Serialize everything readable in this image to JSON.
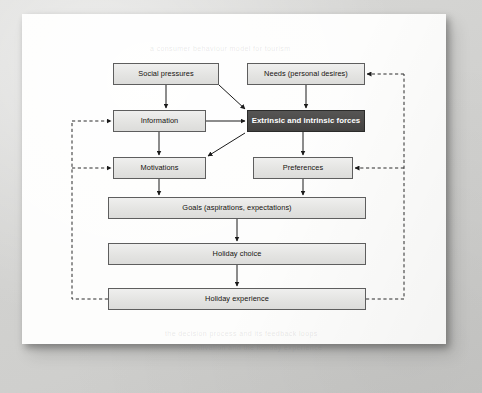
{
  "document": {
    "kind": "scanned-book-page",
    "figure_type": "flow-diagram",
    "page_background_color": "#fdfdfc",
    "surround_color": "#d4d4d2"
  },
  "diagram": {
    "box_fill_color": "#e6e6e4",
    "box_border_color": "#5e5e5e",
    "emphasis_fill_color": "#4c4b4a",
    "emphasis_text_color": "#ffffff",
    "connector_color": "#1a1a1a",
    "feedback_connector_style": "dashed",
    "nodes": [
      {
        "id": "social-pressures",
        "label": "Social pressures",
        "x": 113,
        "y": 63,
        "w": 106,
        "h": 22,
        "emphasis": false
      },
      {
        "id": "needs",
        "label": "Needs (personal desires)",
        "x": 247,
        "y": 63,
        "w": 118,
        "h": 22,
        "emphasis": false
      },
      {
        "id": "information",
        "label": "Information",
        "x": 113,
        "y": 110,
        "w": 93,
        "h": 22,
        "emphasis": false
      },
      {
        "id": "forces",
        "label": "Extrinsic and intrinsic forces",
        "x": 247,
        "y": 110,
        "w": 118,
        "h": 22,
        "emphasis": true
      },
      {
        "id": "motivations",
        "label": "Motivations",
        "x": 113,
        "y": 157,
        "w": 93,
        "h": 22,
        "emphasis": false
      },
      {
        "id": "preferences",
        "label": "Preferences",
        "x": 253,
        "y": 157,
        "w": 100,
        "h": 22,
        "emphasis": false
      },
      {
        "id": "goals",
        "label": "Goals (aspirations, expectations)",
        "x": 108,
        "y": 197,
        "w": 258,
        "h": 22,
        "emphasis": false
      },
      {
        "id": "holiday-choice",
        "label": "Holiday choice",
        "x": 108,
        "y": 243,
        "w": 258,
        "h": 22,
        "emphasis": false
      },
      {
        "id": "holiday-experience",
        "label": "Holiday experience",
        "x": 108,
        "y": 288,
        "w": 258,
        "h": 22,
        "emphasis": false
      }
    ],
    "connectors": [
      {
        "id": "social-to-information",
        "from": "social-pressures",
        "to": "information",
        "style": "solid",
        "kind": "vertical"
      },
      {
        "id": "social-to-forces",
        "from": "social-pressures",
        "to": "forces",
        "style": "solid",
        "kind": "diagonal"
      },
      {
        "id": "needs-to-forces",
        "from": "needs",
        "to": "forces",
        "style": "solid",
        "kind": "vertical"
      },
      {
        "id": "information-to-forces",
        "from": "information",
        "to": "forces",
        "style": "solid",
        "kind": "horizontal"
      },
      {
        "id": "information-to-motivations",
        "from": "information",
        "to": "motivations",
        "style": "solid",
        "kind": "vertical"
      },
      {
        "id": "forces-to-motivations",
        "from": "forces",
        "to": "motivations",
        "style": "solid",
        "kind": "diagonal"
      },
      {
        "id": "forces-to-preferences",
        "from": "forces",
        "to": "preferences",
        "style": "solid",
        "kind": "vertical"
      },
      {
        "id": "motivations-to-goals",
        "from": "motivations",
        "to": "goals",
        "style": "solid",
        "kind": "vertical"
      },
      {
        "id": "preferences-to-goals",
        "from": "preferences",
        "to": "goals",
        "style": "solid",
        "kind": "vertical"
      },
      {
        "id": "goals-to-choice",
        "from": "goals",
        "to": "holiday-choice",
        "style": "solid",
        "kind": "vertical"
      },
      {
        "id": "choice-to-experience",
        "from": "holiday-choice",
        "to": "holiday-experience",
        "style": "solid",
        "kind": "vertical"
      },
      {
        "id": "experience-to-information",
        "from": "holiday-experience",
        "to": "information",
        "style": "dashed",
        "kind": "feedback-left"
      },
      {
        "id": "experience-to-motivations",
        "from": "holiday-experience",
        "to": "motivations",
        "style": "dashed",
        "kind": "feedback-left"
      },
      {
        "id": "experience-to-needs",
        "from": "holiday-experience",
        "to": "needs",
        "style": "dashed",
        "kind": "feedback-right"
      },
      {
        "id": "experience-to-preferences",
        "from": "holiday-experience",
        "to": "preferences",
        "style": "dashed",
        "kind": "feedback-right"
      }
    ]
  },
  "ghost_text": [
    {
      "text": "a consumer behaviour model for tourism",
      "x": 150,
      "y": 45
    },
    {
      "text": "the decision process and its feedback loops",
      "x": 165,
      "y": 330
    },
    {
      "text": "motivation and the holiday experience",
      "x": 190,
      "y": 344
    }
  ]
}
